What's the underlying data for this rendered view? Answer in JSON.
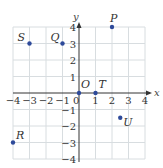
{
  "chart_data": {
    "type": "scatter",
    "title": "",
    "xlabel": "x",
    "ylabel": "y",
    "xlim": [
      -4,
      4
    ],
    "ylim": [
      -4,
      4
    ],
    "grid": true,
    "x_ticks": [
      "-4",
      "-3",
      "-2",
      "-1",
      "0",
      "1",
      "2",
      "3",
      "4"
    ],
    "y_ticks": [
      "4",
      "3",
      "2",
      "1",
      "-1",
      "-2",
      "-3",
      "-4"
    ],
    "points": [
      {
        "label": "P",
        "x": 2,
        "y": 4
      },
      {
        "label": "Q",
        "x": -1,
        "y": 3
      },
      {
        "label": "S",
        "x": -3,
        "y": 3
      },
      {
        "label": "O",
        "x": 0,
        "y": 0
      },
      {
        "label": "T",
        "x": 1,
        "y": 0
      },
      {
        "label": "U",
        "x": 2.5,
        "y": -1.5
      },
      {
        "label": "R",
        "x": -4,
        "y": -3
      }
    ]
  },
  "colors": {
    "grid": "#d8dde0",
    "axis": "#333333",
    "point": "#2e4a9a",
    "last_tick": "#3a8a3a"
  }
}
